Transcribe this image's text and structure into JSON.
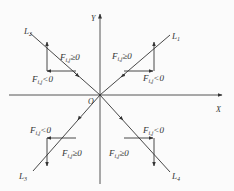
{
  "diagram": {
    "axes": {
      "x_label": "X",
      "y_label": "Y",
      "origin_label": "O"
    },
    "lines": [
      {
        "name": "L1",
        "label": "L",
        "sub": "1",
        "quadrant": "I"
      },
      {
        "name": "L2",
        "label": "L",
        "sub": "2",
        "quadrant": "II"
      },
      {
        "name": "L3",
        "label": "L",
        "sub": "3",
        "quadrant": "III"
      },
      {
        "name": "L4",
        "label": "L",
        "sub": "4",
        "quadrant": "IV"
      }
    ],
    "conditions": {
      "q1_ge": "F",
      "q1_ge_sub": "i,j",
      "q1_ge_rel": "≥0",
      "q1_lt": "F",
      "q1_lt_sub": "i,j",
      "q1_lt_rel": "<0",
      "q2_ge": "F",
      "q2_ge_sub": "i,j",
      "q2_ge_rel": "≥0",
      "q2_lt": "F",
      "q2_lt_sub": "i,j",
      "q2_lt_rel": "<0",
      "q3_ge": "F",
      "q3_ge_sub": "i,j",
      "q3_ge_rel": "≥0",
      "q3_lt": "F",
      "q3_lt_sub": "i,j",
      "q3_lt_rel": "<0",
      "q4_ge": "F",
      "q4_ge_sub": "i,j",
      "q4_ge_rel": "≥0",
      "q4_lt": "F",
      "q4_lt_sub": "i,j",
      "q4_lt_rel": "<0"
    },
    "colors": {
      "stroke": "#333333",
      "background": "#fbfbfb"
    }
  }
}
